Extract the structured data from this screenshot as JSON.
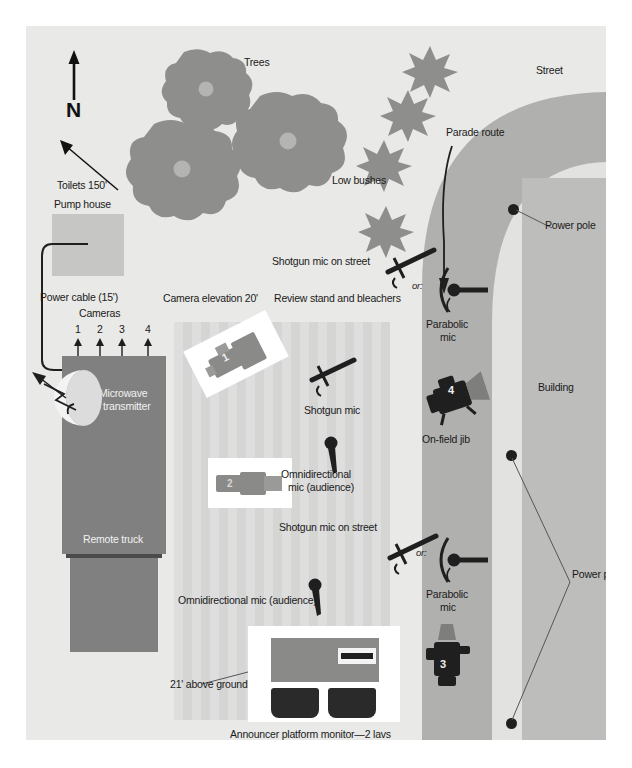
{
  "diagram": {
    "type": "site-plan",
    "background_color": "#e9e9e7",
    "page_background": "#ffffff"
  },
  "compass": {
    "label": "N",
    "direction": "north",
    "arrow": "up"
  },
  "areas": {
    "street": {
      "label": "Street",
      "color": "#b0b0ae"
    },
    "building": {
      "label": "Building",
      "color": "#bdbdbb"
    },
    "pump_house": {
      "label": "Pump house",
      "color": "#c6c6c4"
    },
    "bleachers": {
      "label": "Review stand and bleachers",
      "color": "#dedede"
    },
    "remote_truck": {
      "label": "Remote truck",
      "color": "#808080"
    }
  },
  "vegetation": {
    "trees_label": "Trees",
    "bushes_label": "Low bushes",
    "tree_color": "#8e8e8c",
    "bush_color": "#8e8e8c",
    "tree_count": 3,
    "bush_count": 4
  },
  "annotations": {
    "toilets": "Toilets 150'",
    "power_cable": "Power cable (15')",
    "cameras_header": "Cameras",
    "camera_numbers": [
      "1",
      "2",
      "3",
      "4"
    ],
    "microwave": "Microwave\nto transmitter",
    "microwave_line1": "Microwave",
    "microwave_line2": "to transmitter",
    "camera_elevation": "Camera elevation 20'",
    "parade_route": "Parade route",
    "power_pole": "Power pole",
    "power_poles": "Power poles",
    "or_label": "or:",
    "height_above_ground": "21' above ground",
    "announcer_platform": "Announcer platform monitor—2 lavs"
  },
  "audio": {
    "shotgun_mic_street_upper": "Shotgun mic on street",
    "shotgun_mic_street_lower": "Shotgun mic on street",
    "shotgun_mic": "Shotgun mic",
    "parabolic_mic_upper_line1": "Parabolic",
    "parabolic_mic_upper_line2": "mic",
    "parabolic_mic_lower_line1": "Parabolic",
    "parabolic_mic_lower_line2": "mic",
    "omni_mic_upper_line1": "Omnidirectional",
    "omni_mic_upper_line2": "mic (audience)",
    "omni_mic_lower": "Omnidirectional mic (audience)"
  },
  "cameras": [
    {
      "id": "1",
      "label": "1",
      "placement": "platform on bleachers",
      "elevation": "20'"
    },
    {
      "id": "2",
      "label": "2",
      "placement": "platform on bleachers"
    },
    {
      "id": "3",
      "label": "3",
      "placement": "street"
    },
    {
      "id": "4",
      "label": "4",
      "placement": "on-field jib",
      "caption": "On-field jib"
    }
  ],
  "jib": {
    "label": "On-field jib",
    "camera": "4"
  }
}
